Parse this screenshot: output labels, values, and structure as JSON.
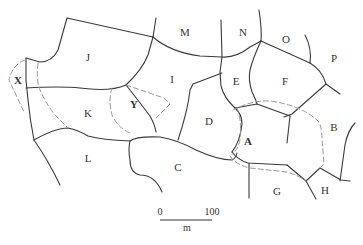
{
  "map": {
    "type": "parcel-boundary-map",
    "parcels": [
      {
        "id": "A",
        "label": "A",
        "x": 248,
        "y": 142,
        "bold": true
      },
      {
        "id": "B",
        "label": "B",
        "x": 334,
        "y": 128,
        "bold": false
      },
      {
        "id": "C",
        "label": "C",
        "x": 178,
        "y": 168,
        "bold": false
      },
      {
        "id": "D",
        "label": "D",
        "x": 209,
        "y": 122,
        "bold": false
      },
      {
        "id": "E",
        "label": "E",
        "x": 236,
        "y": 82,
        "bold": false
      },
      {
        "id": "F",
        "label": "F",
        "x": 285,
        "y": 82,
        "bold": false
      },
      {
        "id": "G",
        "label": "G",
        "x": 277,
        "y": 192,
        "bold": false
      },
      {
        "id": "H",
        "label": "H",
        "x": 325,
        "y": 191,
        "bold": false
      },
      {
        "id": "I",
        "label": "I",
        "x": 172,
        "y": 80,
        "bold": false
      },
      {
        "id": "J",
        "label": "J",
        "x": 88,
        "y": 58,
        "bold": false
      },
      {
        "id": "K",
        "label": "K",
        "x": 88,
        "y": 114,
        "bold": false
      },
      {
        "id": "L",
        "label": "L",
        "x": 88,
        "y": 159,
        "bold": false
      },
      {
        "id": "M",
        "label": "M",
        "x": 185,
        "y": 33,
        "bold": false
      },
      {
        "id": "N",
        "label": "N",
        "x": 243,
        "y": 33,
        "bold": false
      },
      {
        "id": "O",
        "label": "O",
        "x": 286,
        "y": 40,
        "bold": false
      },
      {
        "id": "P",
        "label": "P",
        "x": 334,
        "y": 59,
        "bold": false
      },
      {
        "id": "X",
        "label": "X",
        "x": 18,
        "y": 81,
        "bold": true
      },
      {
        "id": "Y",
        "label": "Y",
        "x": 134,
        "y": 105,
        "bold": true
      }
    ]
  },
  "scale_bar": {
    "start_label": "0",
    "end_label": "100",
    "unit": "m"
  }
}
